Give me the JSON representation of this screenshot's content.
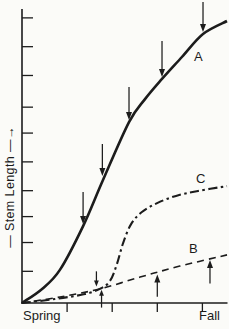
{
  "figure": {
    "background": "#fbfbf8",
    "ink_color": "#1c1c1c",
    "y_axis_label_display": "— Stem Length —→"
  },
  "chart_data": {
    "type": "line",
    "title": "",
    "xlabel": "",
    "ylabel": "Stem Length",
    "x_tick_labels": [
      "Spring",
      "Fall"
    ],
    "x_range": [
      0,
      100
    ],
    "y_range": [
      0,
      100
    ],
    "grid": false,
    "legend": "inline-labels",
    "series": [
      {
        "name": "A",
        "style": "solid",
        "points": [
          [
            0,
            0
          ],
          [
            9.8,
            4.9
          ],
          [
            18.5,
            11.5
          ],
          [
            29.8,
            26.7
          ],
          [
            39.5,
            42.7
          ],
          [
            52.2,
            62.8
          ],
          [
            60,
            70.8
          ],
          [
            68.3,
            77.8
          ],
          [
            78,
            85.4
          ],
          [
            88.3,
            93.4
          ],
          [
            100,
            97.9
          ]
        ]
      },
      {
        "name": "C",
        "style": "dash-dot",
        "points": [
          [
            0,
            0
          ],
          [
            16.1,
            1.4
          ],
          [
            30.7,
            3.1
          ],
          [
            38,
            4.9
          ],
          [
            42.9,
            7.6
          ],
          [
            46.3,
            13.5
          ],
          [
            49.3,
            20.8
          ],
          [
            53.2,
            27.4
          ],
          [
            58.5,
            31.6
          ],
          [
            65.9,
            34.7
          ],
          [
            75.1,
            37.2
          ],
          [
            85.9,
            38.9
          ],
          [
            100,
            40.6
          ]
        ]
      },
      {
        "name": "B",
        "style": "dashed",
        "points": [
          [
            0,
            0
          ],
          [
            18.5,
            2.1
          ],
          [
            38,
            4.9
          ],
          [
            57.6,
            9
          ],
          [
            77,
            12.8
          ],
          [
            100,
            16.7
          ]
        ]
      }
    ],
    "annotations": {
      "down_arrows": [
        {
          "x": 29.8,
          "tip_y": 27.4,
          "tail_y": 38.5
        },
        {
          "x": 39.2,
          "tip_y": 44.1,
          "tail_y": 55.2
        },
        {
          "x": 52.2,
          "tip_y": 63.5,
          "tail_y": 75.0
        },
        {
          "x": 68.3,
          "tip_y": 78.5,
          "tail_y": 91.0
        },
        {
          "x": 88.3,
          "tip_y": 94.1,
          "tail_y": 104.5
        },
        {
          "x": 36.3,
          "tip_y": 5.7,
          "tail_y": 11.0
        }
      ],
      "up_arrows": [
        {
          "x": 38.8,
          "tip_y": 4.6,
          "tail_y": -1.6
        },
        {
          "x": 66.0,
          "tip_y": 9.9,
          "tail_y": 2.2
        },
        {
          "x": 91.7,
          "tip_y": 14.9,
          "tail_y": 6.8
        }
      ]
    },
    "ticks": {
      "y_values": [
        11,
        21,
        30,
        39,
        49,
        59,
        68,
        79,
        89,
        99
      ],
      "x_values": [
        22,
        44,
        66,
        88
      ]
    },
    "layout": {
      "plot_px": {
        "left": 22,
        "right": 227,
        "bottom": 303,
        "top": 15
      },
      "y_axis_top_px": 9,
      "y_tick_len_px": 11,
      "x_tick_len_px": 9
    }
  }
}
